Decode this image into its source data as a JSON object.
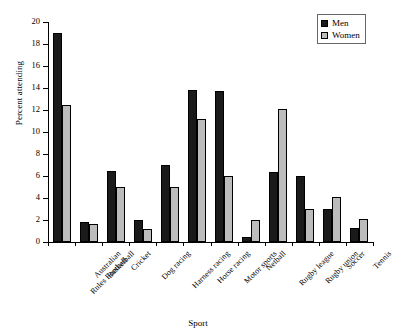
{
  "chart_data": {
    "type": "bar",
    "title": "",
    "xlabel": "Sport",
    "ylabel": "Percent attending",
    "ylim": [
      0,
      20
    ],
    "yticks": [
      0,
      2,
      4,
      6,
      8,
      10,
      12,
      14,
      16,
      18,
      20
    ],
    "grid": false,
    "legend_position": "top-right",
    "categories": [
      "Australian Rules Football",
      "Basketball",
      "Cricket",
      "Dog racing",
      "Harness racing",
      "Horse racing",
      "Motor sports",
      "Netball",
      "Rugby league",
      "Rugby union",
      "Soccer",
      "Tennis"
    ],
    "category_lines": [
      [
        "Australian",
        "Rules Football"
      ],
      [
        "Basketball",
        ""
      ],
      [
        "Cricket",
        ""
      ],
      [
        "Dog racing",
        ""
      ],
      [
        "Harness racing",
        ""
      ],
      [
        "Horse racing",
        ""
      ],
      [
        "Motor sports",
        ""
      ],
      [
        "Netball",
        ""
      ],
      [
        "Rugby league",
        ""
      ],
      [
        "Rugby union",
        ""
      ],
      [
        "Soccer",
        ""
      ],
      [
        "Tennis",
        ""
      ]
    ],
    "series": [
      {
        "name": "Men",
        "color": "#1a1a1a",
        "values": [
          19.0,
          1.8,
          6.5,
          2.0,
          7.0,
          13.8,
          13.7,
          0.5,
          6.4,
          6.0,
          3.0,
          1.3
        ]
      },
      {
        "name": "Women",
        "color": "#bcbcbc",
        "values": [
          12.5,
          1.6,
          5.0,
          1.2,
          5.0,
          11.2,
          6.0,
          2.0,
          12.1,
          3.0,
          4.1,
          2.1
        ]
      }
    ]
  },
  "legend": {
    "items": [
      {
        "label": "Men"
      },
      {
        "label": "Women"
      }
    ]
  }
}
